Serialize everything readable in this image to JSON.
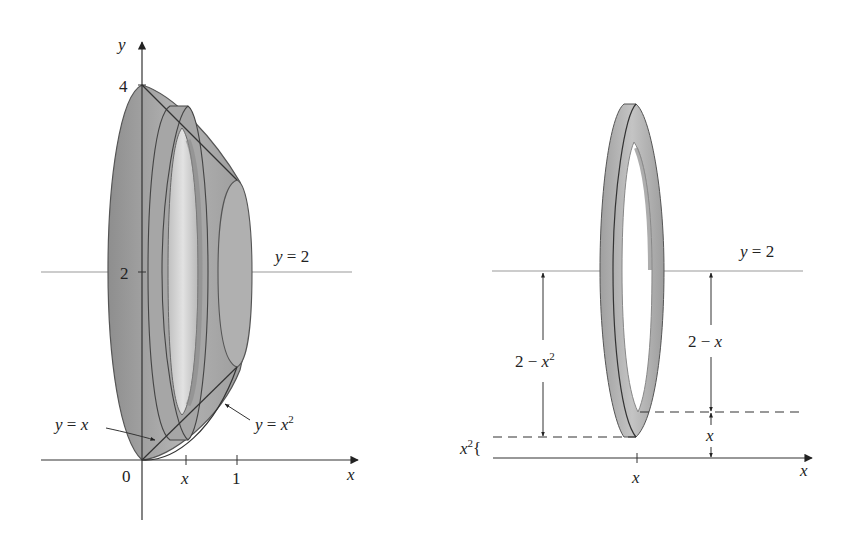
{
  "left_figure": {
    "axis_labels": {
      "y": "y",
      "x": "x"
    },
    "y_ticks": [
      "4",
      "2"
    ],
    "x_ticks": {
      "origin": "0",
      "x": "x",
      "one": "1"
    },
    "line_label": {
      "lhs": "y",
      "eq": " = ",
      "rhs": "2"
    },
    "curve_label_linear": {
      "lhs": "y",
      "eq": " = ",
      "rhs": "x"
    },
    "curve_label_quadratic": {
      "lhs": "y",
      "eq": " = ",
      "rhs": "x",
      "exp": "2"
    }
  },
  "right_figure": {
    "axis_label_x": "x",
    "tick_label": "x",
    "line_label": {
      "lhs": "y",
      "eq": " = ",
      "rhs": "2"
    },
    "outer_radius_label": {
      "text": "2 − ",
      "var": "x",
      "exp": "2"
    },
    "inner_radius_label": {
      "text": "2 − ",
      "var": "x"
    },
    "inner_gap_label": "x",
    "outer_gap_label": {
      "var": "x",
      "exp": "2",
      "brace": "{"
    }
  },
  "colors": {
    "solid_fill": "#9a9a9a",
    "solid_light": "#c8c8c8",
    "line": "#444444",
    "axis_line": "#999999"
  }
}
